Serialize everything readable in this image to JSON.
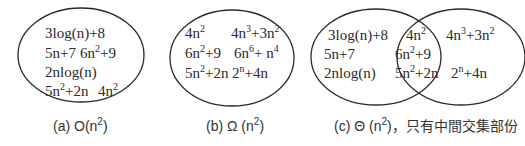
{
  "panels": [
    {
      "id": "a",
      "caption": "(a) O(n²)",
      "caption_parts": {
        "prefix": "(a) O(n",
        "sup": "2",
        "suffix": ")"
      },
      "items": [
        "3log(n)+8",
        "5n+7",
        "6n²+9",
        "2nlog(n)",
        "5n²+2n",
        "4n²"
      ]
    },
    {
      "id": "b",
      "caption": "(b) Ω (n²)",
      "caption_parts": {
        "prefix": "(b) Ω (n",
        "sup": "2",
        "suffix": ")"
      },
      "items": [
        "4n²",
        "4n³+3n²",
        "6n²+9",
        "6n⁶+ n⁴",
        "5n²+2n",
        "2ⁿ+4n"
      ]
    },
    {
      "id": "c",
      "caption": "(c) Θ (n²)，只有中間交集部份",
      "caption_parts": {
        "prefix": "(c) Θ (n",
        "sup": "2",
        "suffix": ")，只有中間交集部份"
      },
      "left_only": [
        "3log(n)+8",
        "5n+7",
        "2nlog(n)"
      ],
      "intersection": [
        "4n²",
        "6n²+9",
        "5n²+2n"
      ],
      "right_only": [
        "4n³+3n²",
        "2ⁿ+4n"
      ]
    }
  ],
  "colors": {
    "stroke": "#2a2a2a",
    "text": "#2a2a2a",
    "caption": "#333333"
  }
}
